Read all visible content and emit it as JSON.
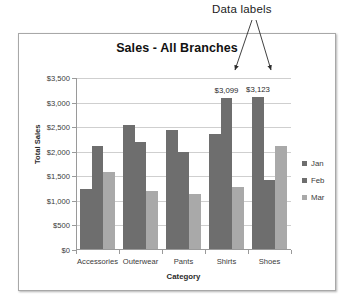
{
  "annotation": {
    "label": "Data labels",
    "arrow_targets": [
      "$3,099",
      "$3,123"
    ]
  },
  "chart_data": {
    "type": "bar",
    "title": "Sales - All Branches",
    "xlabel": "Category",
    "ylabel": "Total Sales",
    "categories": [
      "Accessories",
      "Outerwear",
      "Pants",
      "Shirts",
      "Shoes"
    ],
    "series": [
      {
        "name": "Jan",
        "color": "#6e6e6e",
        "values": [
          1240,
          2550,
          2450,
          2370,
          3123
        ]
      },
      {
        "name": "Feb",
        "color": "#6e6e6e",
        "values": [
          2120,
          2190,
          1990,
          3099,
          1430
        ]
      },
      {
        "name": "Mar",
        "color": "#a9a9a9",
        "values": [
          1580,
          1210,
          1130,
          1280,
          2120
        ]
      }
    ],
    "data_labels": [
      {
        "category": "Shirts",
        "series": "Feb",
        "text": "$3,099",
        "value": 3099
      },
      {
        "category": "Shoes",
        "series": "Jan",
        "text": "$3,123",
        "value": 3123
      }
    ],
    "ylim": [
      0,
      3500
    ],
    "ytick_values": [
      0,
      500,
      1000,
      1500,
      2000,
      2500,
      3000,
      3500
    ],
    "ytick_labels": [
      "$0",
      "$500",
      "$1,000",
      "$1,500",
      "$2,000",
      "$2,500",
      "$3,000",
      "$3,500"
    ],
    "grid": true,
    "legend_position": "right",
    "legend_entries": [
      "Jan",
      "Feb",
      "Mar"
    ]
  }
}
